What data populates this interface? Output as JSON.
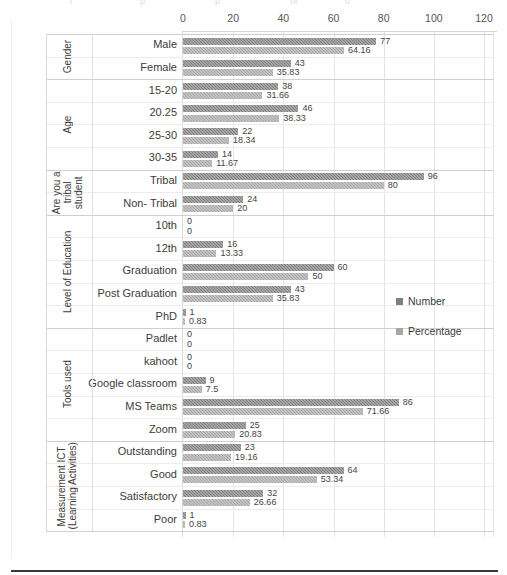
{
  "chart_data": {
    "type": "bar",
    "orientation": "horizontal",
    "title": "",
    "xlabel": "",
    "ylabel": "",
    "xlim": [
      0,
      120
    ],
    "xticks": [
      0,
      20,
      40,
      60,
      80,
      100,
      120
    ],
    "grid": true,
    "legend_position": "right",
    "series": [
      {
        "name": "Number",
        "color": "#7f7f7f",
        "values": [
          77,
          43,
          38,
          46,
          22,
          14,
          96,
          24,
          0,
          16,
          60,
          43,
          1,
          0,
          0,
          9,
          86,
          25,
          23,
          64,
          32,
          1
        ]
      },
      {
        "name": "Percentage",
        "color": "#a6a6a6",
        "values": [
          64.16,
          35.83,
          31.66,
          38.33,
          18.34,
          11.67,
          80,
          20,
          0,
          13.33,
          50,
          35.83,
          0.83,
          0,
          0,
          7.5,
          71.66,
          20.83,
          19.16,
          53.34,
          26.66,
          0.83
        ]
      }
    ],
    "categories": [
      "Male",
      "Female",
      "15-20",
      "20.25",
      "25-30",
      "30-35",
      "Tribal",
      "Non- Tribal",
      "10th",
      "12th",
      "Graduation",
      "Post Graduation",
      "PhD",
      "Padlet",
      "kahoot",
      "Google  classroom",
      "MS Teams",
      "Zoom",
      "Outstanding",
      "Good",
      "Satisfactory",
      "Poor"
    ],
    "value_labels": {
      "number": [
        "77",
        "43",
        "38",
        "46",
        "22",
        "14",
        "96",
        "24",
        "0",
        "16",
        "60",
        "43",
        "1",
        "0",
        "0",
        "9",
        "86",
        "25",
        "23",
        "64",
        "32",
        "1"
      ],
      "percentage": [
        "64.16",
        "35.83",
        "31.66",
        "38.33",
        "18.34",
        "11.67",
        "80",
        "20",
        "0",
        "13.33",
        "50",
        "35.83",
        "0.83",
        "0",
        "0",
        "7.5",
        "71.66",
        "20.83",
        "19.16",
        "53.34",
        "26.66",
        "0.83"
      ]
    },
    "groups": [
      {
        "label": "Gender",
        "start": 0,
        "count": 2
      },
      {
        "label": "Age",
        "start": 2,
        "count": 4
      },
      {
        "label": "Are you a\ntribal\nstudent",
        "start": 6,
        "count": 2
      },
      {
        "label": "Level of Education",
        "start": 8,
        "count": 5
      },
      {
        "label": "Tools used",
        "start": 13,
        "count": 5
      },
      {
        "label": "Measurement ICT\n(Learning Activities)",
        "start": 18,
        "count": 4
      }
    ]
  },
  "legend": {
    "items": [
      {
        "label": "Number",
        "color": "#7f7f7f"
      },
      {
        "label": "Percentage",
        "color": "#a6a6a6"
      }
    ]
  },
  "axis": {
    "tick_labels": [
      "0",
      "20",
      "40",
      "60",
      "80",
      "100",
      "120"
    ]
  },
  "top_artifact": {
    "fragments": [
      "i",
      "p",
      "p",
      "or",
      "o"
    ]
  }
}
